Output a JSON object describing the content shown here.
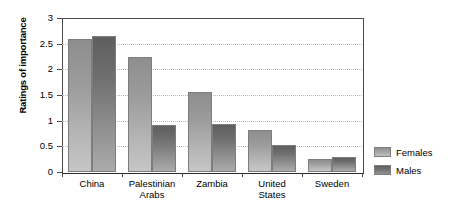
{
  "chart_data": {
    "type": "bar",
    "title": "",
    "xlabel": "",
    "ylabel": "Ratings of importance",
    "ylim": [
      0,
      3
    ],
    "yticks": [
      "0",
      "0.5",
      "1",
      "1.5",
      "2",
      "2.5",
      "3"
    ],
    "grid": true,
    "legend_position": "right",
    "categories": [
      "China",
      "Palestinian\nArabs",
      "Zambia",
      "United\nStates",
      "Sweden"
    ],
    "series": [
      {
        "name": "Females",
        "color": "#a5a5a5",
        "values": [
          2.6,
          2.25,
          1.55,
          0.82,
          0.26
        ]
      },
      {
        "name": "Males",
        "color": "#757575",
        "values": [
          2.65,
          0.92,
          0.93,
          0.52,
          0.29
        ]
      }
    ]
  },
  "legend": {
    "items": [
      {
        "label": "Females",
        "swatch": "females-swatch"
      },
      {
        "label": "Males",
        "swatch": "males-swatch"
      }
    ]
  }
}
